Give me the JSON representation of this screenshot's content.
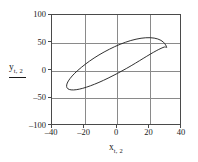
{
  "figure": {
    "background_color": "#ffffff",
    "frame_color": "#4a4a4a",
    "grid_color": "#8a8a8a",
    "curve_color": "#262626"
  },
  "axes": {
    "x_title_var": "x",
    "x_title_sub": "t, 2",
    "y_title_var": "y",
    "y_title_sub": "t, 2",
    "x_ticklabels": [
      "–40",
      "–20",
      "0",
      "20",
      "40"
    ],
    "y_ticklabels": [
      "100",
      "50",
      "0",
      "–50",
      "–100"
    ]
  },
  "chart_data": {
    "type": "line",
    "title": "",
    "subtitle": "",
    "xlabel": "x_t,2",
    "ylabel": "y_t,2",
    "xlim": [
      -40,
      40
    ],
    "ylim": [
      -100,
      100
    ],
    "xticks": [
      -40,
      -20,
      0,
      20,
      40
    ],
    "yticks": [
      -100,
      -50,
      0,
      50,
      100
    ],
    "grid": true,
    "legend": "none",
    "annotations": [],
    "series": [
      {
        "name": "confidence ellipse",
        "shape": "ellipse",
        "closed": true,
        "center": [
          -1,
          -1
        ],
        "semi_major": 46,
        "semi_minor": 19,
        "rotation_deg": 33,
        "x": [
          30.6,
          28.6,
          25.1,
          20.4,
          14.8,
          8.5,
          1.9,
          -4.7,
          -11.1,
          -16.9,
          -21.9,
          -26.0,
          -28.9,
          -30.6,
          -31.0,
          -30.2,
          -28.2,
          -25.1,
          -21.1,
          -16.4,
          -11.1,
          -5.5,
          0.3,
          6.0,
          11.3,
          16.1,
          20.4,
          24.1,
          27.1,
          29.3,
          30.6
        ],
        "y": [
          42.0,
          51.0,
          56.8,
          59.1,
          58.1,
          54.0,
          47.2,
          38.3,
          28.0,
          16.9,
          5.7,
          -4.9,
          -14.5,
          -22.6,
          -28.8,
          -33.0,
          -34.9,
          -34.6,
          -32.1,
          -27.6,
          -21.4,
          -13.8,
          -5.2,
          4.0,
          13.1,
          21.7,
          29.3,
          35.5,
          39.9,
          42.4,
          42.0
        ]
      }
    ]
  },
  "grid_positions": {
    "vertical_px": [
      32.5,
      65,
      97.5
    ],
    "horizontal_px": [
      27.75,
      55.5,
      83.25
    ]
  },
  "tick_positions": {
    "x_px": [
      51,
      83.5,
      116,
      148.5,
      181
    ],
    "y_px": [
      14,
      41.75,
      69.5,
      97.25,
      125
    ]
  }
}
